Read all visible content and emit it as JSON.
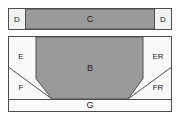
{
  "diagram": {
    "colors": {
      "background": "#ffffff",
      "fill_gray": "#9a9a9a",
      "fill_light": "#f2f2f2",
      "fill_white": "#fafafa",
      "stroke": "#4d4d4d",
      "text": "#1a1a1a"
    },
    "panels": [
      {
        "id": "top-panel",
        "name": "upper-band",
        "zones": [
          {
            "id": "d-left",
            "label": "D",
            "fill": "light"
          },
          {
            "id": "c",
            "label": "C",
            "fill": "gray"
          },
          {
            "id": "d-right",
            "label": "D",
            "fill": "light"
          }
        ]
      },
      {
        "id": "bottom-panel",
        "name": "lower-section",
        "zones": [
          {
            "id": "e",
            "label": "E",
            "fill": "light"
          },
          {
            "id": "er",
            "label": "ER",
            "fill": "light"
          },
          {
            "id": "f",
            "label": "F",
            "fill": "light"
          },
          {
            "id": "fr",
            "label": "FR",
            "fill": "light"
          },
          {
            "id": "b",
            "label": "B",
            "fill": "gray"
          },
          {
            "id": "g",
            "label": "G",
            "fill": "light"
          }
        ]
      }
    ],
    "labels": {
      "d_left": "D",
      "c": "C",
      "d_right": "D",
      "e": "E",
      "er": "ER",
      "f": "F",
      "fr": "FR",
      "b": "B",
      "g": "G"
    }
  }
}
